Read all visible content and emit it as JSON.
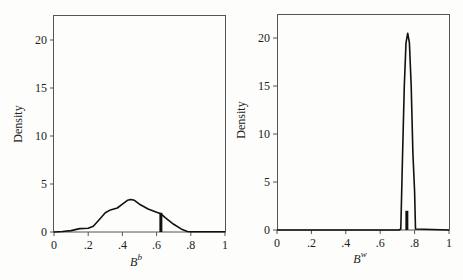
{
  "chart_data": [
    {
      "type": "line",
      "title": "",
      "xlabel": "B^b",
      "xlabel_base": "B",
      "xlabel_sup": "b",
      "ylabel": "Density",
      "xlim": [
        0,
        1
      ],
      "ylim": [
        0,
        22.5
      ],
      "x_ticks": [
        "0",
        ".2",
        ".4",
        ".6",
        ".8",
        "1"
      ],
      "y_ticks": [
        "0",
        "5",
        "10",
        "15",
        "20"
      ],
      "grid": false,
      "series": [
        {
          "name": "density",
          "x": [
            0,
            0.05,
            0.1,
            0.15,
            0.2,
            0.23,
            0.26,
            0.3,
            0.33,
            0.37,
            0.4,
            0.43,
            0.45,
            0.47,
            0.5,
            0.55,
            0.6,
            0.625,
            0.65,
            0.7,
            0.75,
            0.78,
            0.8,
            0.9,
            1
          ],
          "y": [
            0,
            0.05,
            0.15,
            0.35,
            0.4,
            0.6,
            1.2,
            2.0,
            2.3,
            2.5,
            2.9,
            3.3,
            3.4,
            3.3,
            2.9,
            2.4,
            2.05,
            1.9,
            1.5,
            0.8,
            0.25,
            0.05,
            0.02,
            0.02,
            0.02
          ]
        }
      ],
      "marker_bar": {
        "x": 0.625,
        "height": 2.0
      }
    },
    {
      "type": "line",
      "title": "",
      "xlabel": "B^w",
      "xlabel_base": "B",
      "xlabel_sup": "w",
      "ylabel": "Density",
      "xlim": [
        0,
        1
      ],
      "ylim": [
        0,
        22.5
      ],
      "x_ticks": [
        "0",
        ".2",
        ".4",
        ".6",
        ".8",
        "1"
      ],
      "y_ticks": [
        "0",
        "5",
        "10",
        "15",
        "20"
      ],
      "grid": false,
      "series": [
        {
          "name": "density",
          "x": [
            0,
            0.71,
            0.72,
            0.725,
            0.73,
            0.74,
            0.75,
            0.76,
            0.77,
            0.78,
            0.79,
            0.8,
            0.805,
            1
          ],
          "y": [
            0,
            0,
            0.1,
            4.0,
            8.0,
            15.0,
            19.5,
            20.5,
            19.5,
            15.0,
            8.0,
            4.0,
            0.1,
            0
          ]
        }
      ],
      "marker_bar": {
        "x": 0.755,
        "height": 2.0
      }
    }
  ]
}
